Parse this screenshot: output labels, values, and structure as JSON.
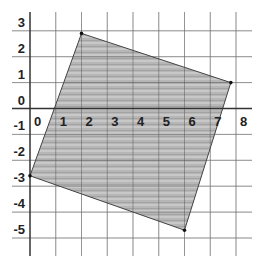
{
  "figure": {
    "colors": {
      "background": "#ffffff",
      "grid": "#c8c8c8",
      "axis": "#333333",
      "shape_fill": "#b4b4b4",
      "shape_stroke": "#333333",
      "vertex": "#111111",
      "label": "#222222"
    },
    "x_axis": {
      "min": 0,
      "max": 8,
      "tick_labels": [
        "0",
        "1",
        "2",
        "3",
        "4",
        "5",
        "6",
        "7",
        "8"
      ]
    },
    "y_axis": {
      "min": -5,
      "max": 3,
      "tick_labels": [
        "3",
        "2",
        "1",
        "0",
        "-1",
        "-2",
        "-3",
        "-4",
        "-5"
      ]
    },
    "quadrilateral": {
      "vertices": [
        {
          "name": "top",
          "x": 2,
          "y": 2.9
        },
        {
          "name": "right",
          "x": 7.8,
          "y": 1
        },
        {
          "name": "bottom",
          "x": 6,
          "y": -4.7
        },
        {
          "name": "left",
          "x": 0,
          "y": -2.6
        }
      ]
    }
  }
}
